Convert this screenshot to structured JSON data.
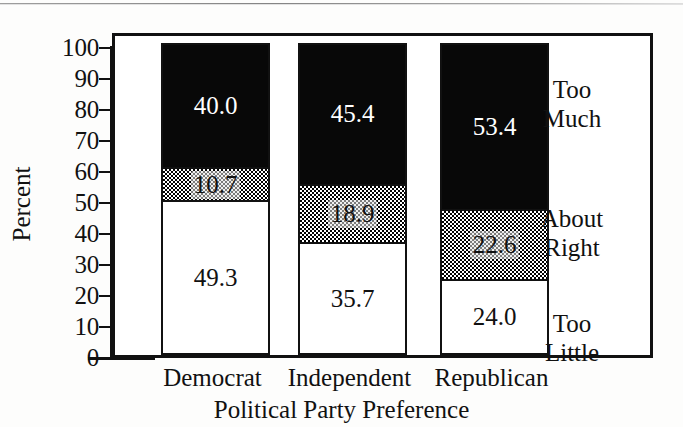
{
  "chart_data": {
    "type": "bar",
    "subtype": "stacked-100-percent",
    "title": "",
    "xlabel": "Political Party Preference",
    "ylabel": "Percent",
    "ylim": [
      0,
      100
    ],
    "yticks": [
      0,
      10,
      20,
      30,
      40,
      50,
      60,
      70,
      80,
      90,
      100
    ],
    "ytick_labels": [
      "0",
      "10",
      "20",
      "30",
      "40",
      "50",
      "60",
      "70",
      "80",
      "90",
      "100"
    ],
    "grid": false,
    "legend_position": "right-inside-plot",
    "categories": [
      "Democrat",
      "Independent",
      "Republican"
    ],
    "series": [
      {
        "name": "Too Little",
        "fill": "white",
        "color": "#ffffff",
        "values": [
          49.3,
          35.7,
          24.0
        ],
        "labels": [
          "49.3",
          "35.7",
          "24.0"
        ]
      },
      {
        "name": "About Right",
        "fill": "checkered-gray",
        "color": "#c9c9c9",
        "values": [
          10.7,
          18.9,
          22.6
        ],
        "labels": [
          "10.7",
          "18.9",
          "22.6"
        ]
      },
      {
        "name": "Too Much",
        "fill": "black",
        "color": "#080808",
        "values": [
          40.0,
          45.4,
          53.4
        ],
        "labels": [
          "40.0",
          "45.4",
          "53.4"
        ]
      }
    ],
    "legend_entries": [
      {
        "line1": "Too",
        "line2": "Much"
      },
      {
        "line1": "About",
        "line2": "Right"
      },
      {
        "line1": "Too",
        "line2": "Little"
      }
    ]
  },
  "axes": {
    "y_title": "Percent",
    "x_title": "Political Party Preference"
  }
}
